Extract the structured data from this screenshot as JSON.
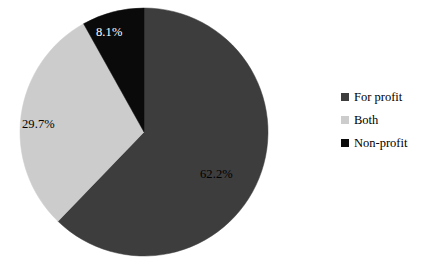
{
  "chart_data": {
    "type": "pie",
    "title": "",
    "categories": [
      "For profit",
      "Both",
      "Non-profit"
    ],
    "values": [
      62.2,
      29.7,
      8.1
    ],
    "value_unit": "%",
    "data_labels": [
      "62.2%",
      "29.7%",
      "8.1%"
    ],
    "colors": [
      "#3d3d3d",
      "#cccccc",
      "#0a0a0a"
    ],
    "label_text_colors": [
      "#000000",
      "#000000",
      "#ffffff"
    ],
    "start_angle_deg": 0,
    "direction": "clockwise",
    "legend_position": "right",
    "grid": false,
    "background": "#ffffff",
    "slices": [
      {
        "label": "For profit",
        "value": 62.2,
        "display": "62.2%",
        "color": "#3d3d3d",
        "start_deg": 0,
        "end_deg": 223.92
      },
      {
        "label": "Both",
        "value": 29.7,
        "display": "29.7%",
        "color": "#cccccc",
        "start_deg": 223.92,
        "end_deg": 330.84
      },
      {
        "label": "Non-profit",
        "value": 8.1,
        "display": "8.1%",
        "color": "#0a0a0a",
        "start_deg": 330.84,
        "end_deg": 360
      }
    ]
  },
  "labels": {
    "for_profit_pct": "62.2%",
    "both_pct": "29.7%",
    "non_profit_pct": "8.1%"
  },
  "legend": {
    "items": [
      {
        "label": "For profit",
        "color": "#3d3d3d"
      },
      {
        "label": "Both",
        "color": "#cccccc"
      },
      {
        "label": "Non-profit",
        "color": "#0a0a0a"
      }
    ]
  }
}
